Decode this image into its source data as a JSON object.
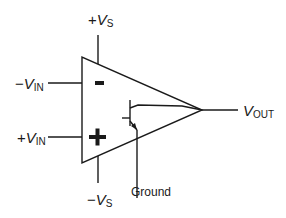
{
  "diagram": {
    "labels": {
      "vs_pos": {
        "prefix": "+",
        "var": "V",
        "sub": "S"
      },
      "vs_neg": {
        "prefix": "−",
        "var": "V",
        "sub": "S"
      },
      "vin_neg": {
        "prefix": "−",
        "var": "V",
        "sub": "IN"
      },
      "vin_pos": {
        "prefix": "+",
        "var": "V",
        "sub": "IN"
      },
      "vout": {
        "prefix": "",
        "var": "V",
        "sub": "OUT"
      },
      "ground": "Ground"
    },
    "input_signs": {
      "inverting": "–",
      "non_inverting": "+"
    },
    "stroke_color": "#1a1a1a"
  }
}
